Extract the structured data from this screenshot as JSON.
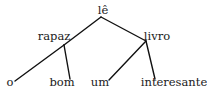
{
  "diagram": {
    "type": "dependency-tree",
    "colors": {
      "line": "#111111",
      "text": "#1a1a1a",
      "background": "#ffffff"
    },
    "nodes": [
      {
        "id": "le",
        "label": "lê",
        "x": 103,
        "y": 14
      },
      {
        "id": "rapaz",
        "label": "rapaz",
        "x": 54,
        "y": 40
      },
      {
        "id": "livro",
        "label": "livro",
        "x": 157,
        "y": 40
      },
      {
        "id": "o",
        "label": "o",
        "x": 10,
        "y": 86
      },
      {
        "id": "bom",
        "label": "bom",
        "x": 62,
        "y": 86
      },
      {
        "id": "um",
        "label": "um",
        "x": 100,
        "y": 86
      },
      {
        "id": "interesante",
        "label": "interesante",
        "x": 174,
        "y": 86
      }
    ],
    "edges": [
      {
        "from": "le",
        "to": "rapaz"
      },
      {
        "from": "le",
        "to": "livro"
      },
      {
        "from": "rapaz",
        "to": "o"
      },
      {
        "from": "rapaz",
        "to": "bom"
      },
      {
        "from": "livro",
        "to": "um"
      },
      {
        "from": "livro",
        "to": "interesante"
      }
    ]
  }
}
